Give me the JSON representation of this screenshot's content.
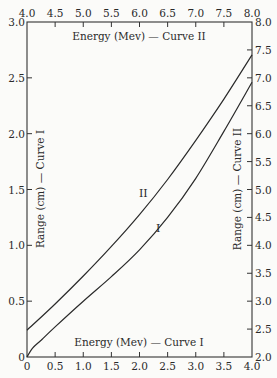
{
  "chart_data": {
    "type": "line",
    "title": "",
    "frame": {
      "left": 27,
      "right": 252,
      "top": 22,
      "bottom": 357
    },
    "axes": {
      "bottom": {
        "label": "Energy (Mev) — Curve I",
        "range": [
          0,
          4.0
        ],
        "ticks": [
          "0",
          "0.5",
          "1.0",
          "1.5",
          "2.0",
          "2.5",
          "3.0",
          "3.5",
          "4.0"
        ]
      },
      "top": {
        "label": "Energy (Mev) — Curve II",
        "range": [
          4.0,
          8.0
        ],
        "ticks": [
          "4.0",
          "4.5",
          "5.0",
          "5.5",
          "6.0",
          "6.5",
          "7.0",
          "7.5",
          "8.0"
        ]
      },
      "left": {
        "label": "Range (cm) — Curve I",
        "range": [
          0,
          3.0
        ],
        "ticks": [
          "0",
          "0.5",
          "1.0",
          "1.5",
          "2.0",
          "2.5",
          "3.0"
        ]
      },
      "right": {
        "label": "Range (cm) — Curve II",
        "range": [
          2.0,
          8.0
        ],
        "ticks": [
          "2.0",
          "2.5",
          "3.0",
          "3.5",
          "4.0",
          "4.5",
          "5.0",
          "5.5",
          "6.0",
          "6.5",
          "7.0",
          "7.5",
          "8.0"
        ]
      }
    },
    "series": [
      {
        "name": "I",
        "x_axis": "bottom",
        "y_axis": "left",
        "x": [
          0,
          0.1,
          0.25,
          0.5,
          1.0,
          1.5,
          2.0,
          2.5,
          3.0,
          3.5,
          4.0
        ],
        "y": [
          0,
          0.08,
          0.15,
          0.27,
          0.5,
          0.72,
          0.96,
          1.25,
          1.6,
          2.02,
          2.46
        ]
      },
      {
        "name": "II",
        "x_axis": "top",
        "y_axis": "right",
        "x": [
          4.0,
          4.5,
          5.0,
          5.5,
          6.0,
          6.5,
          7.0,
          7.5,
          8.0
        ],
        "y": [
          2.48,
          2.95,
          3.45,
          3.98,
          4.55,
          5.18,
          5.88,
          6.62,
          7.41
        ]
      }
    ],
    "annotations": [
      {
        "text": "II",
        "series": "II"
      },
      {
        "text": "I",
        "series": "I"
      }
    ],
    "grid": false,
    "legend": "none"
  },
  "labels": {
    "bottom_title": "Energy (Mev) — Curve I",
    "top_title": "Energy (Mev) — Curve II",
    "left_title": "Range (cm) — Curve I",
    "right_title": "Range (cm) — Curve II",
    "curve_I": "I",
    "curve_II": "II"
  }
}
